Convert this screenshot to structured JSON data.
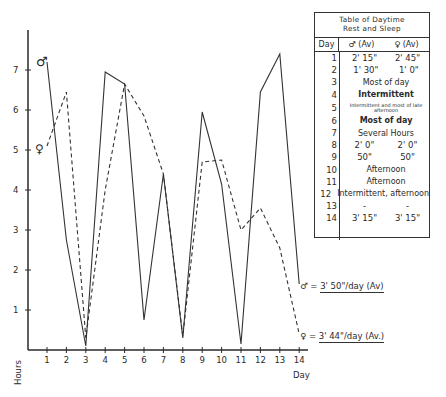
{
  "chart_data": {
    "type": "line",
    "title": "",
    "xlabel": "Day",
    "ylabel": "Hours",
    "x": [
      1,
      2,
      3,
      4,
      5,
      6,
      7,
      8,
      9,
      10,
      11,
      12,
      13,
      14
    ],
    "xticks": [
      "1",
      "2",
      "3",
      "4",
      "5",
      "6",
      "7",
      "8",
      "9",
      "10",
      "11",
      "12",
      "13",
      "14"
    ],
    "yticks": [
      "1",
      "2",
      "3",
      "4",
      "5",
      "6",
      "7"
    ],
    "ylim": [
      0,
      8
    ],
    "grid": false,
    "series": [
      {
        "name": "♂",
        "style": "solid",
        "values": [
          7.2,
          2.75,
          0.1,
          6.95,
          6.65,
          0.75,
          4.4,
          0.3,
          5.95,
          4.15,
          0.15,
          6.45,
          7.4,
          1.65
        ]
      },
      {
        "name": "♀",
        "style": "dashed",
        "values": [
          5.1,
          6.45,
          0.3,
          4.0,
          6.65,
          5.85,
          4.4,
          0.35,
          4.7,
          4.75,
          3.0,
          3.55,
          2.55,
          0.4
        ]
      }
    ],
    "annotations": [
      {
        "symbol": "♂",
        "text": "3' 50\"/day (Av)"
      },
      {
        "symbol": "♀",
        "text": "3' 44\"/day (Av.)"
      }
    ],
    "table": {
      "title_line1": "Table of Daytime",
      "title_line2": "Rest and Sleep",
      "headers": [
        "Day",
        "♂ (Av)",
        "♀ (Av)"
      ],
      "rows": [
        {
          "day": "1",
          "male": "2' 15\"",
          "female": "2' 45\""
        },
        {
          "day": "2",
          "male": "1' 30\"",
          "female": "1' 0\""
        },
        {
          "day": "3",
          "span": "Most of day"
        },
        {
          "day": "4",
          "span": "Intermittent"
        },
        {
          "day": "5",
          "span": "Intermittent and most of late afternoon"
        },
        {
          "day": "6",
          "span": "Most of day"
        },
        {
          "day": "7",
          "span": "Several Hours"
        },
        {
          "day": "8",
          "male": "2' 0\"",
          "female": "2' 0\""
        },
        {
          "day": "9",
          "male": "50\"",
          "female": "50\""
        },
        {
          "day": "10",
          "span": "Afternoon"
        },
        {
          "day": "11",
          "span": "Afternoon"
        },
        {
          "day": "12",
          "span": "Intermittent, afternoon"
        },
        {
          "day": "13",
          "male": "-",
          "female": "-"
        },
        {
          "day": "14",
          "male": "3' 15\"",
          "female": "3' 15\""
        }
      ]
    }
  },
  "labels": {
    "male_symbol": "♂",
    "female_symbol": "♀",
    "male_avg": "3' 50\"/day (Av)",
    "female_avg": "3' 44\"/day (Av.)",
    "equals": "=",
    "xlabel": "Day",
    "ylabel": "Hours"
  },
  "colors": {
    "ink": "#2a2a2a",
    "paper": "#ffffff"
  }
}
